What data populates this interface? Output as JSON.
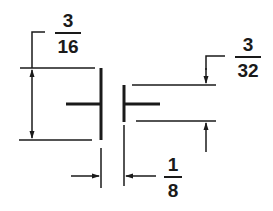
{
  "diagram": {
    "type": "weld-joint-dimension-drawing",
    "colors": {
      "ink": "#1a1a1a",
      "background": "#ffffff"
    },
    "dimensions": [
      {
        "id": "plate-thickness",
        "numerator": "3",
        "denominator": "16"
      },
      {
        "id": "offset",
        "numerator": "3",
        "denominator": "32"
      },
      {
        "id": "gap",
        "numerator": "1",
        "denominator": "8"
      }
    ]
  }
}
